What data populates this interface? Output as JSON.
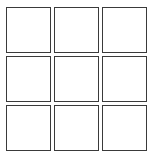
{
  "board": {
    "rows": 3,
    "cols": 3,
    "line_color": "#3a3a3a",
    "cells": [
      {
        "row": 0,
        "col": 0,
        "mark": ""
      },
      {
        "row": 0,
        "col": 1,
        "mark": ""
      },
      {
        "row": 0,
        "col": 2,
        "mark": ""
      },
      {
        "row": 1,
        "col": 0,
        "mark": ""
      },
      {
        "row": 1,
        "col": 1,
        "mark": ""
      },
      {
        "row": 1,
        "col": 2,
        "mark": ""
      },
      {
        "row": 2,
        "col": 0,
        "mark": ""
      },
      {
        "row": 2,
        "col": 1,
        "mark": ""
      },
      {
        "row": 2,
        "col": 2,
        "mark": ""
      }
    ]
  }
}
